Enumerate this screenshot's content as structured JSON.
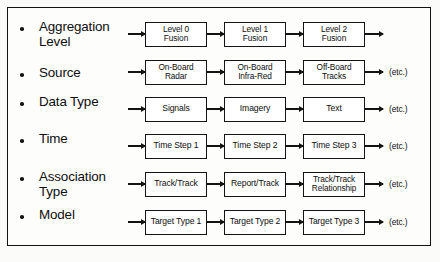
{
  "diagram": {
    "frame": {
      "border_color": "#131313",
      "background": "#fdfdfc"
    },
    "arrow_glyph": "arrow-right-icon",
    "bullet_glyph": "bullet-icon",
    "rows": [
      {
        "label": "Aggregation\nLevel",
        "boxes": [
          "Level 0\nFusion",
          "Level 1\nFusion",
          "Level 2\nFusion"
        ],
        "trailing": ""
      },
      {
        "label": "Source",
        "boxes": [
          "On-Board\nRadar",
          "On-Board\nInfra-Red",
          "Off-Board\nTracks"
        ],
        "trailing": "(etc.)"
      },
      {
        "label": "Data Type",
        "boxes": [
          "Signals",
          "Imagery",
          "Text"
        ],
        "trailing": "(etc.)"
      },
      {
        "label": "Time",
        "boxes": [
          "Time Step 1",
          "Time Step 2",
          "Time Step 3"
        ],
        "trailing": "(etc.)"
      },
      {
        "label": "Association\nType",
        "boxes": [
          "Track/Track",
          "Report/Track",
          "Track/Track\nRelationship"
        ],
        "trailing": "(etc.)"
      },
      {
        "label": "Model",
        "boxes": [
          "Target Type 1",
          "Target Type 2",
          "Target Type 3"
        ],
        "trailing": "(etc.)"
      }
    ]
  }
}
